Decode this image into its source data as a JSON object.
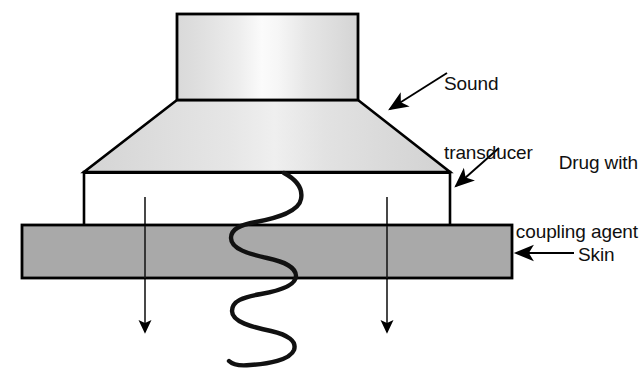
{
  "diagram": {
    "type": "schematic-cross-section"
  },
  "labels": {
    "sound_transducer": "Sound\ntransducer",
    "sound_transducer_line1": "Sound",
    "sound_transducer_line2": "transducer",
    "drug_coupling": "Drug with\ncoupling agent",
    "drug_coupling_line1": "Drug with",
    "drug_coupling_line2": "coupling agent",
    "skin": "Skin"
  },
  "parts": {
    "transducer_body": {
      "name": "Sound transducer body",
      "shape": "rectangle",
      "x": 177,
      "y": 14,
      "width": 181,
      "height": 86
    },
    "transducer_horn": {
      "name": "Sound transducer horn",
      "shape": "trapezoid",
      "points": "177,100 358,100 450,172 84,172"
    },
    "drug_chamber": {
      "name": "Drug with coupling agent chamber",
      "shape": "rectangle",
      "x": 84,
      "y": 172,
      "width": 366,
      "height": 54
    },
    "skin_layer": {
      "name": "Skin",
      "shape": "rectangle",
      "x": 22,
      "y": 225,
      "width": 490,
      "height": 53
    }
  },
  "annotations": {
    "sound_transducer_arrow": {
      "from_x": 446,
      "from_y": 74,
      "to_x": 388,
      "to_y": 110
    },
    "drug_coupling_arrow": {
      "from_x": 448,
      "from_y": 155,
      "to_x": 455,
      "to_y": 187
    },
    "skin_arrow": {
      "from_x": 572,
      "from_y": 254,
      "to_x": 517,
      "to_y": 254
    }
  },
  "flow_arrows": [
    {
      "name": "left-penetration-arrow",
      "x": 145,
      "y_start": 197,
      "y_end": 338
    },
    {
      "name": "right-penetration-arrow",
      "x": 387,
      "y_start": 197,
      "y_end": 338
    }
  ],
  "wave": {
    "name": "ultrasound-wave",
    "description": "Serpentine sound wave passing from transducer through drug layer into skin",
    "start_x": 284,
    "start_y": 172,
    "end_x": 229,
    "end_y": 361
  },
  "colors": {
    "transducer_light": "#f4f4f4",
    "transducer_mid": "#dedede",
    "horn_fill": "#d9d9d9",
    "chamber_fill": "#ffffff",
    "skin_fill": "#a9a9a9",
    "outline": "#000000",
    "text": "#101010",
    "background": "#ffffff"
  }
}
